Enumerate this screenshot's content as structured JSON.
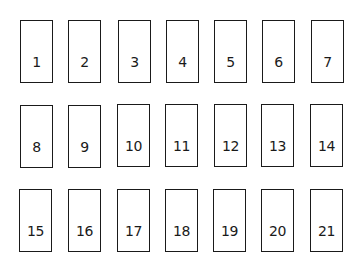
{
  "diagram": {
    "type": "numbered-box-grid",
    "rows": 3,
    "columns": 7,
    "colors": {
      "border": "#1a1a1a",
      "background": "#ffffff",
      "text": "#1a1a1a"
    },
    "boxes": [
      {
        "label": "1"
      },
      {
        "label": "2"
      },
      {
        "label": "3"
      },
      {
        "label": "4"
      },
      {
        "label": "5"
      },
      {
        "label": "6"
      },
      {
        "label": "7"
      },
      {
        "label": "8"
      },
      {
        "label": "9"
      },
      {
        "label": "10"
      },
      {
        "label": "11"
      },
      {
        "label": "12"
      },
      {
        "label": "13"
      },
      {
        "label": "14"
      },
      {
        "label": "15"
      },
      {
        "label": "16"
      },
      {
        "label": "17"
      },
      {
        "label": "18"
      },
      {
        "label": "19"
      },
      {
        "label": "20"
      },
      {
        "label": "21"
      }
    ]
  }
}
